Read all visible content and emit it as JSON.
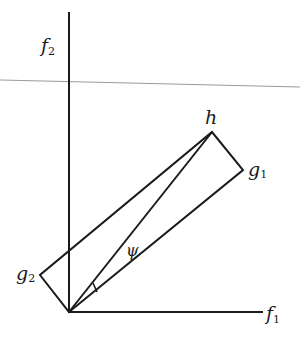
{
  "diagram": {
    "type": "vector-geometry",
    "axes": {
      "x": {
        "label": "f",
        "subscript": "1"
      },
      "y": {
        "label": "f",
        "subscript": "2"
      }
    },
    "vectors": [
      {
        "name": "g1",
        "label": "g",
        "subscript": "1"
      },
      {
        "name": "g2",
        "label": "g",
        "subscript": "2"
      },
      {
        "name": "h",
        "label": "h"
      }
    ],
    "angle": {
      "label": "ψ"
    },
    "colors": {
      "stroke": "#1a1a1a",
      "guide_line": "#9a9a9a"
    }
  }
}
